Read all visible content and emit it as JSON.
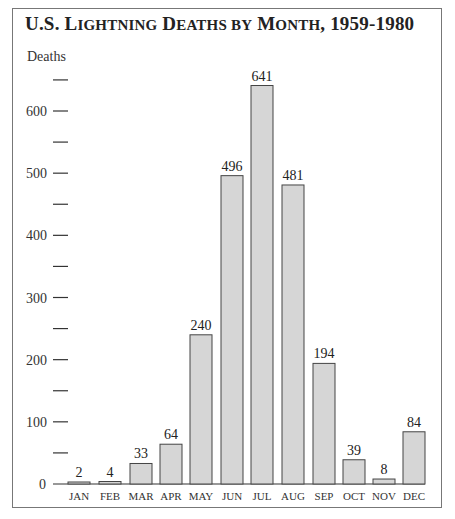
{
  "chart_data": {
    "type": "bar",
    "title": "U.S. Lightning Deaths by Month, 1959-1980",
    "xlabel": "",
    "ylabel": "Deaths",
    "categories": [
      "JAN",
      "FEB",
      "MAR",
      "APR",
      "MAY",
      "JUN",
      "JUL",
      "AUG",
      "SEP",
      "OCT",
      "NOV",
      "DEC"
    ],
    "values": [
      2,
      4,
      33,
      64,
      240,
      496,
      641,
      481,
      194,
      39,
      8,
      84
    ],
    "ylim": [
      0,
      650
    ],
    "y_tick_labels": [
      "0",
      "100",
      "200",
      "300",
      "400",
      "500",
      "600"
    ],
    "y_tick_values": [
      0,
      100,
      200,
      300,
      400,
      500,
      600
    ],
    "y_minor_ticks": [
      50,
      150,
      250,
      350,
      450,
      550,
      650
    ],
    "grid": false,
    "legend": null,
    "data_labels": true,
    "bar_color": "#d6d6d6",
    "bar_edge_color": "#444444"
  },
  "header": {
    "title_parts": [
      {
        "text": "U.S. L",
        "sc": false
      },
      {
        "text": "IGHTNING",
        "sc": true
      },
      {
        "text": " D",
        "sc": false
      },
      {
        "text": "EATHS BY",
        "sc": true
      },
      {
        "text": " M",
        "sc": false
      },
      {
        "text": "ONTH",
        "sc": true
      },
      {
        "text": ", 1959-1980",
        "sc": false
      }
    ]
  }
}
